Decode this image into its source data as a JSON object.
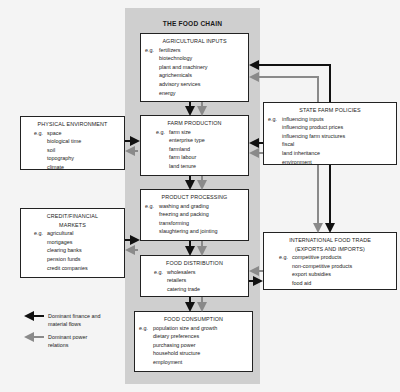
{
  "diagram": {
    "title": "THE FOOD CHAIN",
    "chain_boxes": [
      {
        "id": "agricultural-inputs",
        "title": "AGRICULTURAL INPUTS",
        "eg": "e.g.",
        "items": [
          "fertilizers",
          "biotechnology",
          "plant and machinery",
          "agrichemicals",
          "advisory services",
          "energy"
        ]
      },
      {
        "id": "farm-production",
        "title": "FARM PRODUCTION",
        "eg": "e.g.",
        "items": [
          "farm size",
          "enterprise type",
          "farmland",
          "farm labour",
          "land tenure"
        ]
      },
      {
        "id": "product-processing",
        "title": "PRODUCT PROCESSING",
        "eg": "e.g.",
        "items": [
          "washing and grading",
          "freezing and packing",
          "transforming",
          "slaughtering and jointing"
        ]
      },
      {
        "id": "food-distribution",
        "title": "FOOD DISTRIBUTION",
        "eg": "e.g.",
        "items": [
          "wholesalers",
          "retailers",
          "catering trade"
        ]
      },
      {
        "id": "food-consumption",
        "title": "FOOD CONSUMPTION",
        "eg": "e.g.",
        "items": [
          "population size and growth",
          "dietary preferences",
          "purchasing power",
          "household structure",
          "employment"
        ]
      }
    ],
    "side_boxes": [
      {
        "id": "physical-environment",
        "title": "PHYSICAL ENVIRONMENT",
        "eg": "e.g.",
        "items": [
          "space",
          "biological time",
          "soil",
          "topography",
          "climate"
        ]
      },
      {
        "id": "credit-financial-markets",
        "title": "CREDIT/FINANCIAL MARKETS",
        "eg": "e.g.",
        "items": [
          "agricultural",
          "mortgages",
          "clearing banks",
          "pension funds",
          "credit companies"
        ]
      },
      {
        "id": "state-farm-policies",
        "title": "STATE FARM POLICIES",
        "eg": "e.g.",
        "items": [
          "influencing inputs",
          "influencing product prices",
          "influencing farm structures",
          "fiscal",
          "land inheritance",
          "environment"
        ]
      },
      {
        "id": "international-food-trade",
        "title": "INTERNATIONAL FOOD TRADE (EXPORTS AND IMPORTS)",
        "eg": "e.g.",
        "items": [
          "competitive products",
          "non-competitive products",
          "export subsidies",
          "food aid"
        ]
      }
    ],
    "legend": [
      {
        "label": "Dominant finance and material flows",
        "color": "#111111"
      },
      {
        "label": "Dominant power relations",
        "color": "#8a8a8a"
      }
    ]
  },
  "colors": {
    "finance_flow": "#111111",
    "power_relation": "#8a8a8a",
    "chain_background": "#cfcfcf",
    "page_background": "#f4f4f4"
  }
}
